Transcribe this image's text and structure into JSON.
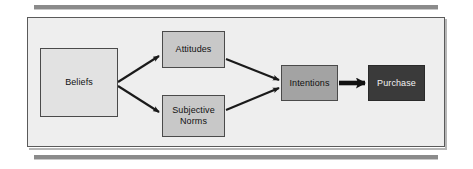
{
  "diagram": {
    "type": "flow-diagram",
    "background_color": "#eeeeee",
    "frame_border_color": "#5a5a5a",
    "nodes": [
      {
        "id": "beliefs",
        "label": "Beliefs",
        "fill": "#e2e2e2",
        "text_color": "#111111"
      },
      {
        "id": "attitudes",
        "label": "Attitudes",
        "fill": "#c8c8c8",
        "text_color": "#111111"
      },
      {
        "id": "subjective_norms",
        "label_line1": "Subjective",
        "label_line2": "Norms",
        "fill": "#c8c8c8",
        "text_color": "#111111"
      },
      {
        "id": "intentions",
        "label": "Intentions",
        "fill": "#a3a3a3",
        "text_color": "#111111"
      },
      {
        "id": "purchase",
        "label": "Purchase",
        "fill": "#3a3a3a",
        "text_color": "#f2f2f2"
      }
    ],
    "edges": [
      {
        "id": "beliefs-attitudes",
        "from": "Beliefs",
        "to": "Attitudes",
        "style": "thin-arrow"
      },
      {
        "id": "beliefs-subjective-norms",
        "from": "Beliefs",
        "to": "Subjective Norms",
        "style": "thin-arrow"
      },
      {
        "id": "attitudes-intentions",
        "from": "Attitudes",
        "to": "Intentions",
        "style": "thin-arrow"
      },
      {
        "id": "subjective-norms-intentions",
        "from": "Subjective Norms",
        "to": "Intentions",
        "style": "thin-arrow"
      },
      {
        "id": "intentions-purchase",
        "from": "Intentions",
        "to": "Purchase",
        "style": "thick-arrow"
      }
    ]
  }
}
